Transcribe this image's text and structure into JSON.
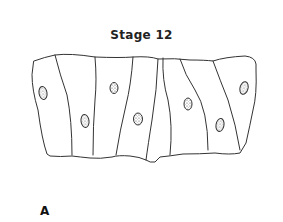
{
  "figure": {
    "title": "Stage 12",
    "panel_label": "A",
    "cell_count": 8,
    "nuclei_count": 8,
    "line_color": "#333333",
    "nucleus_fill": "#cfcfcf"
  }
}
